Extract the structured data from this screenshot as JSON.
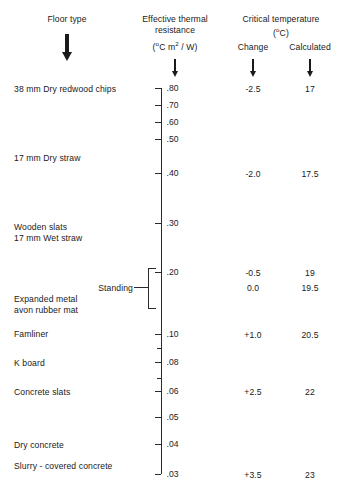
{
  "chart_data": {
    "type": "table",
    "columns": [
      "Floor type",
      "Effective thermal resistance (°C m2 / W)",
      "Critical temperature change (°C)",
      "Critical temperature calculated (°C)"
    ],
    "axis": {
      "label": "Effective thermal resistance",
      "units": "(°C m2 / W)",
      "scale": "logarithmic-descending",
      "range": [
        0.03,
        0.8
      ],
      "tick_values": [
        0.8,
        0.7,
        0.6,
        0.5,
        0.4,
        0.3,
        0.2,
        0.1,
        0.09,
        0.08,
        0.07,
        0.06,
        0.05,
        0.04,
        0.03
      ],
      "tick_labels": [
        ".80",
        ".70",
        ".60",
        ".50",
        ".40",
        ".30",
        ".20",
        ".10",
        "",
        ".08",
        "",
        ".06",
        ".05",
        ".04",
        ".03"
      ]
    },
    "rows": [
      {
        "floor_type": "38 mm Dry redwood chips",
        "resistance": 0.8,
        "change": "-2.5",
        "calculated": "17"
      },
      {
        "floor_type": "17 mm Dry straw",
        "resistance": 0.4,
        "change": "-2.0",
        "calculated": "17.5"
      },
      {
        "floor_type": "Wooden slats / 17 mm Wet straw",
        "resistance": 0.2,
        "change": "-0.5",
        "calculated": "19"
      },
      {
        "floor_type": "Expanded metal / avon rubber mat (Standing)",
        "resistance": 0.15,
        "change": "0.0",
        "calculated": "19.5"
      },
      {
        "floor_type": "Famliner",
        "resistance": 0.1,
        "change": "+1.0",
        "calculated": "20.5"
      },
      {
        "floor_type": "K board",
        "resistance": 0.08,
        "change": "",
        "calculated": ""
      },
      {
        "floor_type": "Concrete slats",
        "resistance": 0.06,
        "change": "+2.5",
        "calculated": "22"
      },
      {
        "floor_type": "Dry concrete",
        "resistance": 0.04,
        "change": "",
        "calculated": ""
      },
      {
        "floor_type": "Slurry - covered concrete",
        "resistance": 0.035,
        "change": "",
        "calculated": ""
      },
      {
        "floor_type": "",
        "resistance": 0.03,
        "change": "+3.5",
        "calculated": "23"
      }
    ]
  },
  "headers": {
    "floor_type": "Floor type",
    "resistance_line1": "Effective thermal",
    "resistance_line2": "resistance",
    "resistance_units_pre": "(",
    "resistance_units_deg": "o",
    "resistance_units_mid": "C m",
    "resistance_units_exp": "2",
    "resistance_units_post": " / W)",
    "critical_temp": "Critical temperature",
    "critical_units_pre": "(",
    "critical_units_deg": "o",
    "critical_units_post": "C)",
    "change": "Change",
    "calculated": "Calculated"
  },
  "labels": {
    "redwood": "38 mm Dry redwood chips",
    "dry_straw": "17 mm Dry straw",
    "wooden_slats": "Wooden slats",
    "wet_straw": "17 mm Wet straw",
    "standing": "Standing",
    "expanded_metal": "Expanded metal",
    "rubber_mat": "avon rubber mat",
    "famliner": "Famliner",
    "k_board": "K board",
    "concrete_slats": "Concrete slats",
    "dry_concrete": "Dry concrete",
    "slurry_concrete": "Slurry - covered concrete"
  },
  "ticks": [
    {
      "label": ".80",
      "y": 88,
      "major": true
    },
    {
      "label": ".70",
      "y": 105,
      "major": true
    },
    {
      "label": ".60",
      "y": 122,
      "major": true
    },
    {
      "label": ".50",
      "y": 139,
      "major": true
    },
    {
      "label": ".40",
      "y": 173,
      "major": true
    },
    {
      "label": ".30",
      "y": 223,
      "major": true
    },
    {
      "label": ".20",
      "y": 272,
      "major": true
    },
    {
      "label": ".10",
      "y": 334,
      "major": true
    },
    {
      "label": "",
      "y": 348,
      "major": false
    },
    {
      "label": ".08",
      "y": 362,
      "major": true
    },
    {
      "label": "",
      "y": 378,
      "major": false
    },
    {
      "label": ".06",
      "y": 391,
      "major": true
    },
    {
      "label": ".05",
      "y": 417,
      "major": true
    },
    {
      "label": ".04",
      "y": 444,
      "major": true
    },
    {
      "label": ".03",
      "y": 474,
      "major": true
    }
  ],
  "values": {
    "change": [
      {
        "text": "-2.5",
        "y": 88
      },
      {
        "text": "-2.0",
        "y": 173
      },
      {
        "text": "-0.5",
        "y": 272
      },
      {
        "text": "0.0",
        "y": 287
      },
      {
        "text": "+1.0",
        "y": 334
      },
      {
        "text": "+2.5",
        "y": 391
      },
      {
        "text": "+3.5",
        "y": 474
      }
    ],
    "calculated": [
      {
        "text": "17",
        "y": 88
      },
      {
        "text": "17.5",
        "y": 173
      },
      {
        "text": "19",
        "y": 272
      },
      {
        "text": "19.5",
        "y": 287
      },
      {
        "text": "20.5",
        "y": 334
      },
      {
        "text": "22",
        "y": 391
      },
      {
        "text": "23",
        "y": 474
      }
    ]
  },
  "colors": {
    "ink": "#1a1a1a",
    "rule": "#2b2b2b",
    "background": "#ffffff"
  }
}
